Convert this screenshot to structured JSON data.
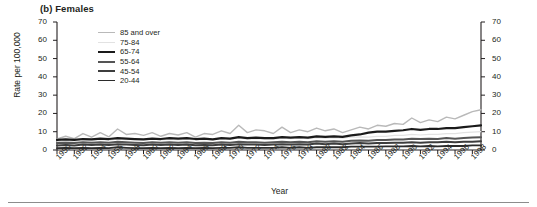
{
  "panel": {
    "title": "(b) Females"
  },
  "axes": {
    "ylabel": "Rate per 100,000",
    "xlabel": "Year",
    "y_ticks": [
      0,
      10,
      20,
      30,
      40,
      50,
      60,
      70
    ],
    "y_tick_labels": [
      "0",
      "10",
      "20",
      "30",
      "40",
      "50",
      "60",
      "70"
    ],
    "x_tick_labels": [
      "1950",
      "1952",
      "1954",
      "1956",
      "1958",
      "1960",
      "1962",
      "1964",
      "1966",
      "1968",
      "1970",
      "1972",
      "1974",
      "1976",
      "1978",
      "1980",
      "1982",
      "1984",
      "1986",
      "1988",
      "1990",
      "1992",
      "1994",
      "1996",
      "1998"
    ]
  },
  "legend": {
    "items": [
      {
        "label": "85 and over",
        "color": "#b9b9b9",
        "width": 1.4
      },
      {
        "label": "75-84",
        "color": "#e2e2e2",
        "width": 1.2
      },
      {
        "label": "65-74",
        "color": "#1a1a1a",
        "width": 2.2
      },
      {
        "label": "55-64",
        "color": "#555555",
        "width": 2.0
      },
      {
        "label": "45-54",
        "color": "#3d3d3d",
        "width": 2.0
      },
      {
        "label": "20-44",
        "color": "#2b2b2b",
        "width": 1.8
      }
    ]
  },
  "chart_data": {
    "type": "line",
    "title": "(b) Females",
    "xlabel": "Year",
    "ylabel": "Rate per 100,000",
    "ylim": [
      0,
      70
    ],
    "xlim": [
      1950,
      1999
    ],
    "grid": false,
    "legend_position": "upper-left-inside",
    "x": [
      1950,
      1951,
      1952,
      1953,
      1954,
      1955,
      1956,
      1957,
      1958,
      1959,
      1960,
      1961,
      1962,
      1963,
      1964,
      1965,
      1966,
      1967,
      1968,
      1969,
      1970,
      1971,
      1972,
      1973,
      1974,
      1975,
      1976,
      1977,
      1978,
      1979,
      1980,
      1981,
      1982,
      1983,
      1984,
      1985,
      1986,
      1987,
      1988,
      1989,
      1990,
      1991,
      1992,
      1993,
      1994,
      1995,
      1996,
      1997,
      1998,
      1999
    ],
    "series": [
      {
        "name": "85 and over",
        "color": "#b9b9b9",
        "values": [
          6.0,
          7.5,
          6.2,
          9.0,
          7.0,
          9.5,
          7.2,
          11.5,
          8.5,
          9.0,
          8.0,
          9.5,
          7.5,
          9.0,
          8.2,
          9.5,
          7.0,
          9.0,
          8.5,
          10.5,
          9.0,
          13.5,
          9.5,
          11.0,
          10.5,
          9.0,
          12.5,
          9.5,
          11.0,
          10.0,
          12.0,
          10.5,
          11.5,
          9.5,
          11.0,
          12.5,
          11.5,
          13.5,
          13.0,
          14.5,
          14.0,
          17.5,
          15.0,
          16.5,
          15.5,
          18.0,
          17.0,
          19.0,
          21.0,
          22.0
        ]
      },
      {
        "name": "75-84",
        "color": "#e2e2e2",
        "values": [
          4.5,
          5.0,
          4.8,
          5.5,
          5.0,
          5.8,
          5.2,
          6.0,
          5.5,
          5.8,
          5.5,
          6.0,
          5.5,
          5.8,
          5.5,
          6.0,
          5.5,
          5.8,
          5.5,
          6.2,
          6.0,
          6.5,
          6.0,
          6.2,
          6.0,
          6.0,
          6.5,
          6.2,
          6.5,
          6.2,
          6.8,
          6.5,
          6.8,
          6.5,
          7.0,
          7.2,
          7.0,
          7.5,
          7.5,
          8.0,
          8.0,
          8.5,
          8.2,
          8.5,
          8.5,
          9.0,
          9.0,
          9.5,
          9.8,
          10.0
        ]
      },
      {
        "name": "65-74",
        "color": "#1a1a1a",
        "values": [
          5.5,
          5.8,
          5.5,
          6.0,
          5.8,
          6.2,
          6.0,
          6.5,
          6.2,
          6.0,
          5.8,
          6.2,
          6.0,
          6.5,
          6.2,
          6.5,
          6.0,
          6.2,
          5.8,
          6.5,
          6.2,
          7.0,
          6.5,
          6.8,
          6.5,
          6.5,
          7.0,
          6.8,
          7.0,
          6.8,
          7.5,
          7.2,
          7.5,
          7.2,
          8.0,
          8.5,
          9.5,
          10.0,
          10.0,
          10.5,
          10.8,
          11.5,
          11.0,
          11.5,
          11.5,
          12.0,
          12.0,
          12.5,
          13.0,
          13.5
        ]
      },
      {
        "name": "55-64",
        "color": "#555555",
        "values": [
          3.8,
          4.0,
          3.8,
          4.2,
          4.0,
          4.2,
          4.0,
          4.5,
          4.2,
          4.0,
          3.8,
          4.2,
          4.0,
          4.2,
          4.0,
          4.2,
          3.8,
          4.0,
          3.8,
          4.2,
          4.0,
          4.5,
          4.2,
          4.2,
          4.0,
          4.2,
          4.5,
          4.2,
          4.5,
          4.2,
          4.8,
          4.5,
          4.8,
          4.5,
          5.0,
          5.2,
          5.0,
          5.5,
          5.5,
          5.8,
          5.8,
          6.2,
          6.0,
          6.2,
          6.0,
          6.5,
          6.2,
          6.5,
          6.8,
          7.0
        ]
      },
      {
        "name": "45-54",
        "color": "#3d3d3d",
        "values": [
          2.5,
          2.8,
          2.5,
          3.0,
          2.8,
          3.0,
          2.8,
          3.2,
          3.0,
          2.8,
          2.6,
          3.0,
          2.8,
          3.0,
          2.8,
          3.0,
          2.6,
          2.8,
          2.6,
          3.0,
          2.8,
          3.2,
          3.0,
          3.0,
          2.8,
          3.0,
          3.2,
          3.0,
          3.2,
          3.0,
          3.5,
          3.2,
          3.5,
          3.2,
          3.5,
          3.8,
          3.5,
          3.8,
          3.8,
          4.0,
          4.0,
          4.2,
          4.0,
          4.2,
          4.2,
          4.5,
          4.2,
          4.5,
          4.5,
          4.8
        ]
      },
      {
        "name": "20-44",
        "color": "#2b2b2b",
        "values": [
          1.0,
          1.2,
          1.0,
          1.2,
          1.0,
          1.2,
          1.0,
          1.5,
          1.2,
          1.0,
          1.0,
          1.2,
          1.0,
          1.2,
          1.0,
          1.2,
          1.0,
          1.2,
          1.0,
          1.2,
          1.2,
          1.5,
          1.2,
          1.2,
          1.2,
          1.2,
          1.5,
          1.2,
          1.5,
          1.2,
          1.5,
          1.5,
          1.5,
          1.5,
          1.8,
          1.8,
          1.8,
          1.8,
          2.0,
          2.0,
          2.0,
          2.2,
          2.0,
          2.2,
          2.0,
          2.2,
          2.2,
          2.2,
          2.5,
          2.5
        ]
      }
    ]
  }
}
